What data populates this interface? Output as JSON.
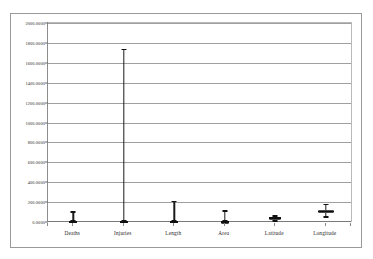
{
  "chart_data": {
    "type": "box",
    "title": "",
    "xlabel": "",
    "ylabel": "",
    "ylim": [
      0,
      2000
    ],
    "grid": true,
    "legend": false,
    "legend_position": "none",
    "ytick_labels": [
      "2000.0000",
      "1800.0000",
      "1600.0000",
      "1400.0000",
      "1200.0000",
      "1000.0000",
      "800.0000",
      "600.0000",
      "400.0000",
      "200.0000",
      "0.0000"
    ],
    "ytick_values": [
      2000,
      1800,
      1600,
      1400,
      1200,
      1000,
      800,
      600,
      400,
      200,
      0
    ],
    "categories": [
      "Deaths",
      "Injuries",
      "Length",
      "Area",
      "Latitude",
      "Longitude"
    ],
    "boxes": [
      {
        "name": "Deaths",
        "min": 0,
        "q1": 0,
        "median": 0,
        "q3": 6,
        "max": 110
      },
      {
        "name": "Injuries",
        "min": 0,
        "q1": 0,
        "median": 0,
        "q3": 12,
        "max": 1740
      },
      {
        "name": "Length",
        "min": 0,
        "q1": 0,
        "median": 2,
        "q3": 10,
        "max": 215
      },
      {
        "name": "Area",
        "min": 0,
        "q1": 0,
        "median": 0,
        "q3": 4,
        "max": 120
      },
      {
        "name": "Latitude",
        "min": 0,
        "q1": 30,
        "median": 38,
        "q3": 44,
        "max": 70
      },
      {
        "name": "Longitude",
        "min": 40,
        "q1": 88,
        "median": 105,
        "q3": 125,
        "max": 185
      }
    ],
    "colors": {
      "box_fill": "#a8a8a8",
      "box_edge": "#4a4a4a",
      "whisker": "#1a1a1a",
      "median": "#101010",
      "gridline": "#9f9f9f",
      "axis": "#8d8d8d",
      "frame": "#9a9a9a",
      "background": "#ffffff"
    }
  }
}
